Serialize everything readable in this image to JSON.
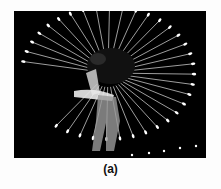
{
  "figure": {
    "caption": "(a)",
    "colors": {
      "background": "#000000",
      "trace": "#e8e8e8",
      "page": "#fdfdfd"
    }
  }
}
